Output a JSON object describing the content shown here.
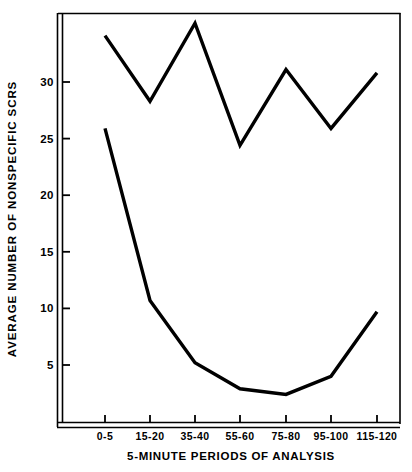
{
  "chart_data": {
    "type": "line",
    "title": "",
    "xlabel": "5-MINUTE PERIODS OF ANALYSIS",
    "ylabel": "AVERAGE NUMBER OF NONSPECIFIC SCRS",
    "categories": [
      "0-5",
      "15-20",
      "35-40",
      "55-60",
      "75-80",
      "95-100",
      "115-120"
    ],
    "yticks": [
      5,
      10,
      15,
      20,
      25,
      30
    ],
    "ytick_labels": [
      "5",
      "10",
      "15",
      "20",
      "25",
      "30"
    ],
    "ylim": [
      0,
      36.5
    ],
    "grid": false,
    "legend": "none",
    "line_color": "#000000",
    "axis_color": "#000000",
    "background": "#ffffff",
    "series": [
      {
        "name": "upper-series",
        "values": [
          34.1,
          28.3,
          35.2,
          24.4,
          31.1,
          25.9,
          30.8
        ]
      },
      {
        "name": "lower-series",
        "values": [
          25.9,
          10.7,
          5.2,
          2.9,
          2.4,
          4.0,
          9.7
        ]
      }
    ]
  }
}
